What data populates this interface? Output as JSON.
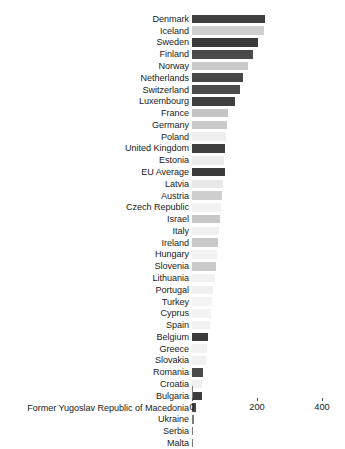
{
  "chart_data": {
    "type": "bar",
    "orientation": "horizontal",
    "title": "",
    "subtitle": "",
    "xlabel": "",
    "ylabel": "",
    "xlim": [
      0,
      400
    ],
    "xticks": [
      0,
      200,
      400
    ],
    "xtick_labels": [
      "0",
      "200",
      "400"
    ],
    "grid": false,
    "legend": null,
    "categories": [
      "Denmark",
      "Iceland",
      "Sweden",
      "Finland",
      "Norway",
      "Netherlands",
      "Switzerland",
      "Luxembourg",
      "France",
      "Germany",
      "Poland",
      "United Kingdom",
      "Estonia",
      "EU Average",
      "Latvia",
      "Austria",
      "Czech Republic",
      "Israel",
      "Italy",
      "Ireland",
      "Hungary",
      "Slovenia",
      "Lithuania",
      "Portugal",
      "Turkey",
      "Cyprus",
      "Spain",
      "Belgium",
      "Greece",
      "Slovakia",
      "Romania",
      "Croatia",
      "Bulgaria",
      "Former Yugoslav Republic of Macedonia",
      "Ukraine",
      "Serbia",
      "Malta"
    ],
    "values": [
      225,
      222,
      203,
      188,
      172,
      157,
      148,
      132,
      111,
      108,
      105,
      102,
      98,
      102,
      95,
      92,
      88,
      85,
      82,
      80,
      76,
      74,
      70,
      66,
      62,
      58,
      54,
      50,
      46,
      42,
      34,
      30,
      31,
      12,
      5,
      4,
      4
    ],
    "bar_colors": [
      "#3f3f3f",
      "#cfcfcf",
      "#3b3b3b",
      "#4a4a4a",
      "#c9c9c9",
      "#474747",
      "#4b4b4b",
      "#3f3f3f",
      "#c4c4c4",
      "#c9c9c9",
      "#efefef",
      "#3f3f3f",
      "#ececec",
      "#3b3b3b",
      "#e8e8e8",
      "#cfcfcf",
      "#f2f2f2",
      "#c7c7c7",
      "#f0f0f0",
      "#c9c9c9",
      "#f2f2f2",
      "#cacaca",
      "#f1f1f1",
      "#f0f0f0",
      "#f4f4f4",
      "#f3f3f3",
      "#f2f2f2",
      "#3c3c3c",
      "#f2f2f2",
      "#f0f0f0",
      "#4a4a4a",
      "#f0f0f0",
      "#3d3d3d",
      "#4a4a4a",
      "#7c7c7c",
      "#7c7c7c",
      "#7c7c7c"
    ]
  },
  "axis": {
    "tick_0": "0",
    "tick_1": "200",
    "tick_2": "400"
  }
}
